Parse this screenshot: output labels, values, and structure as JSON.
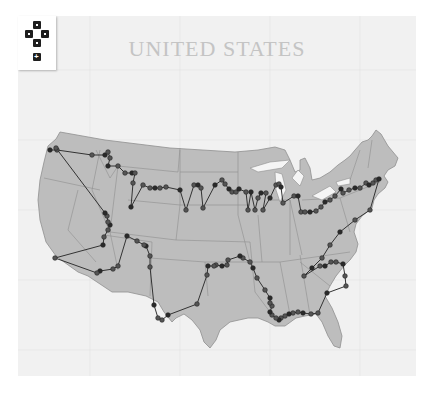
{
  "map": {
    "title": "UNITED STATES",
    "land_color": "#bdbdbd",
    "border_color": "#8a8a8a",
    "route_color": "#333333",
    "stop_color": "#555555",
    "background_color": "#f1f1f1"
  },
  "controls": {
    "pan_up": "pan-up",
    "pan_left": "pan-left",
    "pan_right": "pan-right",
    "pan_down": "pan-down",
    "zoom_in": "+"
  },
  "route": {
    "stops": [
      [
        50,
        150
      ],
      [
        57,
        150
      ],
      [
        92,
        155
      ],
      [
        105,
        155
      ],
      [
        108,
        152
      ],
      [
        110,
        158
      ],
      [
        108,
        166
      ],
      [
        118,
        166
      ],
      [
        125,
        173
      ],
      [
        132,
        173
      ],
      [
        135,
        173
      ],
      [
        133,
        183
      ],
      [
        131,
        207
      ],
      [
        143,
        185
      ],
      [
        150,
        188
      ],
      [
        155,
        188
      ],
      [
        160,
        188
      ],
      [
        166,
        187
      ],
      [
        180,
        190
      ],
      [
        186,
        210
      ],
      [
        194,
        185
      ],
      [
        198,
        185
      ],
      [
        201,
        188
      ],
      [
        203,
        208
      ],
      [
        215,
        185
      ],
      [
        222,
        180
      ],
      [
        225,
        184
      ],
      [
        229,
        189
      ],
      [
        232,
        192
      ],
      [
        236,
        192
      ],
      [
        239,
        189
      ],
      [
        246,
        192
      ],
      [
        248,
        210
      ],
      [
        251,
        192
      ],
      [
        255,
        210
      ],
      [
        258,
        198
      ],
      [
        261,
        193
      ],
      [
        266,
        193
      ],
      [
        263,
        210
      ],
      [
        270,
        198
      ],
      [
        276,
        185
      ],
      [
        279,
        184
      ],
      [
        281,
        187
      ],
      [
        283,
        203
      ],
      [
        294,
        196
      ],
      [
        298,
        196
      ],
      [
        301,
        212
      ],
      [
        305,
        212
      ],
      [
        310,
        212
      ],
      [
        316,
        211
      ],
      [
        321,
        207
      ],
      [
        325,
        202
      ],
      [
        330,
        200
      ],
      [
        335,
        196
      ],
      [
        341,
        189
      ],
      [
        343,
        193
      ],
      [
        349,
        190
      ],
      [
        355,
        188
      ],
      [
        360,
        188
      ],
      [
        366,
        183
      ],
      [
        369,
        185
      ],
      [
        373,
        183
      ],
      [
        376,
        180
      ],
      [
        379,
        179
      ],
      [
        370,
        210
      ],
      [
        355,
        220
      ],
      [
        340,
        232
      ],
      [
        330,
        245
      ],
      [
        322,
        258
      ],
      [
        312,
        268
      ],
      [
        304,
        276
      ],
      [
        320,
        266
      ],
      [
        325,
        266
      ],
      [
        331,
        262
      ],
      [
        336,
        262
      ],
      [
        343,
        264
      ],
      [
        345,
        276
      ],
      [
        346,
        286
      ],
      [
        327,
        293
      ],
      [
        318,
        313
      ],
      [
        311,
        314
      ],
      [
        303,
        313
      ],
      [
        298,
        312
      ],
      [
        293,
        313
      ],
      [
        289,
        314
      ],
      [
        285,
        316
      ],
      [
        281,
        318
      ],
      [
        279,
        320
      ],
      [
        276,
        318
      ],
      [
        272,
        315
      ],
      [
        270,
        312
      ],
      [
        272,
        306
      ],
      [
        270,
        303
      ],
      [
        270,
        298
      ],
      [
        265,
        290
      ],
      [
        257,
        278
      ],
      [
        253,
        268
      ],
      [
        250,
        262
      ],
      [
        243,
        258
      ],
      [
        240,
        256
      ],
      [
        228,
        260
      ],
      [
        227,
        265
      ],
      [
        222,
        266
      ],
      [
        216,
        265
      ],
      [
        214,
        266
      ],
      [
        208,
        266
      ],
      [
        207,
        275
      ],
      [
        197,
        304
      ],
      [
        168,
        315
      ],
      [
        162,
        320
      ],
      [
        158,
        318
      ],
      [
        154,
        305
      ],
      [
        150,
        267
      ],
      [
        150,
        256
      ],
      [
        146,
        246
      ],
      [
        144,
        245
      ],
      [
        137,
        241
      ],
      [
        127,
        236
      ],
      [
        118,
        266
      ],
      [
        113,
        269
      ],
      [
        100,
        271
      ],
      [
        97,
        273
      ],
      [
        55,
        258
      ],
      [
        103,
        245
      ],
      [
        104,
        237
      ],
      [
        108,
        230
      ],
      [
        110,
        225
      ],
      [
        108,
        222
      ],
      [
        107,
        216
      ],
      [
        105,
        213
      ],
      [
        56,
        148
      ]
    ]
  }
}
